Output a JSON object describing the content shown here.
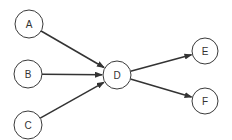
{
  "diagram": {
    "type": "directed-graph",
    "nodes": [
      {
        "id": "A",
        "label": "A",
        "cx": 29,
        "cy": 24,
        "r": 14
      },
      {
        "id": "B",
        "label": "B",
        "cx": 28,
        "cy": 74,
        "r": 14
      },
      {
        "id": "C",
        "label": "C",
        "cx": 28,
        "cy": 125,
        "r": 14
      },
      {
        "id": "D",
        "label": "D",
        "cx": 117,
        "cy": 75,
        "r": 14
      },
      {
        "id": "E",
        "label": "E",
        "cx": 205,
        "cy": 51,
        "r": 13
      },
      {
        "id": "F",
        "label": "F",
        "cx": 205,
        "cy": 101,
        "r": 13
      }
    ],
    "edges": [
      {
        "from": "A",
        "to": "D"
      },
      {
        "from": "B",
        "to": "D"
      },
      {
        "from": "C",
        "to": "D"
      },
      {
        "from": "D",
        "to": "E"
      },
      {
        "from": "D",
        "to": "F"
      }
    ],
    "colors": {
      "stroke": "#3a3a3a",
      "edge": "#333333",
      "fill": "#ffffff"
    }
  }
}
